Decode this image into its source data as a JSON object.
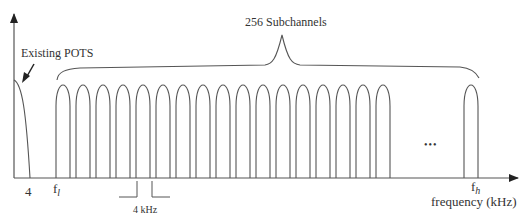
{
  "diagram": {
    "title_label": "256 Subchannels",
    "pots_label": "Existing POTS",
    "x_axis_label": "frequency (kHz)",
    "tick_labels": {
      "pots_edge": "4",
      "f_low_base": "f",
      "f_low_sub": "l",
      "f_high_base": "f",
      "f_high_sub": "h"
    },
    "spacing_label": "4 kHz",
    "ellipsis": "•••",
    "subchannel_count": 256,
    "visible_subchannels_before_ellipsis": 17,
    "visible_subchannels_after_ellipsis": 1,
    "line_color": "#555555",
    "text_color": "#333333"
  }
}
